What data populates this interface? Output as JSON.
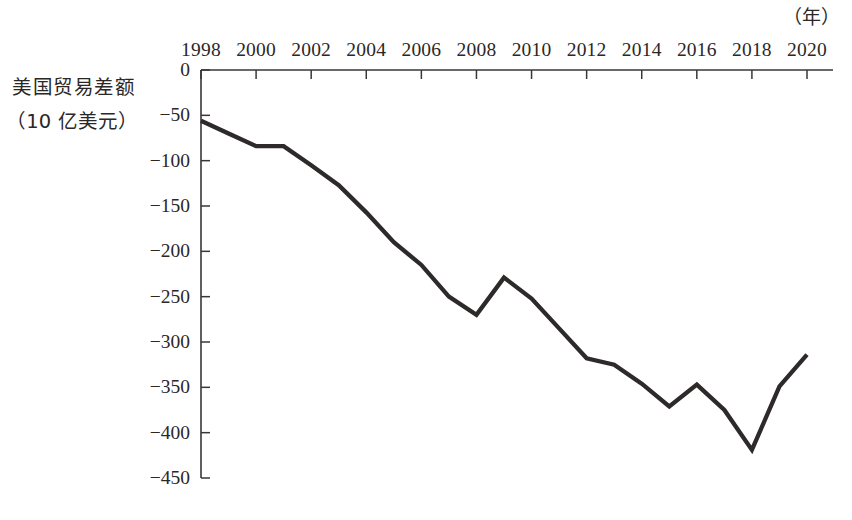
{
  "chart_data": {
    "type": "line",
    "title": "",
    "subtitle": "",
    "xlabel": "（年）",
    "ylabel_lines": [
      "美国贸易差额",
      "（10 亿美元）"
    ],
    "ylabel": "美国贸易差额（10 亿美元）",
    "x": [
      1998,
      1999,
      2000,
      2001,
      2002,
      2003,
      2004,
      2005,
      2006,
      2007,
      2008,
      2009,
      2010,
      2011,
      2012,
      2013,
      2014,
      2015,
      2016,
      2017,
      2018,
      2019,
      2020
    ],
    "values": [
      -56,
      -70,
      -84,
      -84,
      -105,
      -127,
      -157,
      -190,
      -215,
      -250,
      -270,
      -229,
      -252,
      -285,
      -318,
      -325,
      -346,
      -371,
      -347,
      -375,
      -419,
      -349,
      -314
    ],
    "series": [
      {
        "name": "美国贸易差额",
        "values": [
          -56,
          -70,
          -84,
          -84,
          -105,
          -127,
          -157,
          -190,
          -215,
          -250,
          -270,
          -229,
          -252,
          -285,
          -318,
          -325,
          -346,
          -371,
          -347,
          -375,
          -419,
          -349,
          -314
        ]
      }
    ],
    "xticks": [
      1998,
      2000,
      2002,
      2004,
      2006,
      2008,
      2010,
      2012,
      2014,
      2016,
      2018,
      2020
    ],
    "xtick_labels": [
      "1998",
      "2000",
      "2002",
      "2004",
      "2006",
      "2008",
      "2010",
      "2012",
      "2014",
      "2016",
      "2018",
      "2020"
    ],
    "yticks": [
      0,
      -50,
      -100,
      -150,
      -200,
      -250,
      -300,
      -350,
      -400,
      -450
    ],
    "ytick_labels": [
      "0",
      "−50",
      "−100",
      "−150",
      "−200",
      "−250",
      "−300",
      "−350",
      "−400",
      "−450"
    ],
    "xlim": [
      1998,
      2020
    ],
    "ylim": [
      -450,
      0
    ],
    "grid": false,
    "legend": false,
    "legend_position": "none",
    "line_color": "#2e2a2a",
    "axis_color": "#3a3636",
    "background_color": "#ffffff"
  }
}
